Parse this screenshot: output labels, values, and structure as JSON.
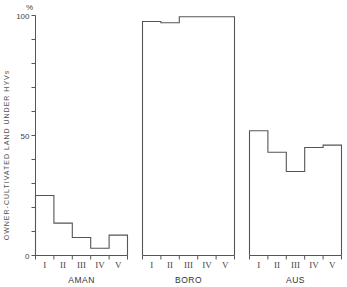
{
  "chart_data": {
    "type": "bar",
    "title": "",
    "xlabel": "",
    "ylabel": "OWNER-CULTIVATED LAND UNDER HYVs",
    "y_unit": "%",
    "ylim": [
      0,
      100
    ],
    "y_ticks": [
      0,
      50,
      100
    ],
    "y_minor_step": 10,
    "grid": false,
    "categories": [
      "I",
      "II",
      "III",
      "IV",
      "V"
    ],
    "panels": [
      {
        "name": "AMAN",
        "values": [
          25,
          13.5,
          7.5,
          3,
          8.5
        ]
      },
      {
        "name": "BORO",
        "values": [
          97.5,
          97,
          99.5,
          99.5,
          99.5
        ]
      },
      {
        "name": "AUS",
        "values": [
          52,
          43,
          35,
          45,
          46
        ]
      }
    ]
  },
  "axis": {
    "unit_label": "%",
    "tick_labels": [
      "0",
      "50",
      "100"
    ]
  }
}
